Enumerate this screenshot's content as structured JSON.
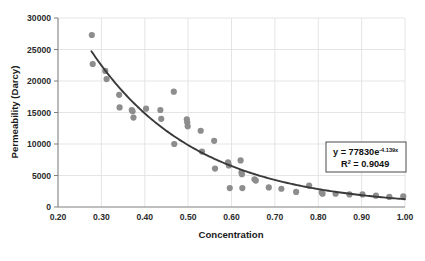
{
  "chart_data": {
    "type": "scatter",
    "title": "",
    "xlabel": "Concentration",
    "ylabel": "Permeability (Darcy)",
    "xlim": [
      0.2,
      1.0
    ],
    "ylim": [
      0,
      30000
    ],
    "xticks": [
      "0.20",
      "0.30",
      "0.40",
      "0.50",
      "0.60",
      "0.70",
      "0.80",
      "0.90",
      "1.00"
    ],
    "xtick_values": [
      0.2,
      0.3,
      0.4,
      0.5,
      0.6,
      0.7,
      0.8,
      0.9,
      1.0
    ],
    "yticks": [
      "0",
      "5000",
      "10000",
      "15000",
      "20000",
      "25000",
      "30000"
    ],
    "ytick_values": [
      0,
      5000,
      10000,
      15000,
      20000,
      25000,
      30000
    ],
    "grid": true,
    "grid_axis": "both",
    "legend": false,
    "marker_color": "#8d8d8d",
    "trendline_color": "#3a3a3a",
    "grid_color": "#e2e2e2",
    "axis_color": "#808080",
    "series": [
      {
        "name": "Permeability vs Concentration",
        "marker": "circle",
        "points": [
          [
            0.278,
            27300
          ],
          [
            0.28,
            22700
          ],
          [
            0.309,
            21600
          ],
          [
            0.312,
            20300
          ],
          [
            0.341,
            17800
          ],
          [
            0.342,
            15800
          ],
          [
            0.37,
            15400
          ],
          [
            0.372,
            15200
          ],
          [
            0.374,
            14200
          ],
          [
            0.403,
            15600
          ],
          [
            0.436,
            15400
          ],
          [
            0.438,
            14000
          ],
          [
            0.467,
            18300
          ],
          [
            0.468,
            10000
          ],
          [
            0.497,
            13900
          ],
          [
            0.498,
            13400
          ],
          [
            0.499,
            12800
          ],
          [
            0.529,
            12100
          ],
          [
            0.532,
            8800
          ],
          [
            0.56,
            10500
          ],
          [
            0.562,
            6100
          ],
          [
            0.592,
            7100
          ],
          [
            0.594,
            6600
          ],
          [
            0.596,
            3000
          ],
          [
            0.621,
            7400
          ],
          [
            0.623,
            5500
          ],
          [
            0.624,
            5200
          ],
          [
            0.625,
            3000
          ],
          [
            0.653,
            4400
          ],
          [
            0.656,
            4200
          ],
          [
            0.686,
            3100
          ],
          [
            0.715,
            2900
          ],
          [
            0.749,
            2400
          ],
          [
            0.779,
            3400
          ],
          [
            0.808,
            2300
          ],
          [
            0.81,
            2100
          ],
          [
            0.84,
            2100
          ],
          [
            0.872,
            2000
          ],
          [
            0.902,
            2000
          ],
          [
            0.933,
            1800
          ],
          [
            0.964,
            1600
          ],
          [
            0.996,
            1700
          ]
        ]
      }
    ],
    "trendline": {
      "type": "exponential",
      "coefficient": 77830,
      "exponent": -4.139,
      "r_squared": 0.9049,
      "x_start": 0.277,
      "x_end": 1.0
    },
    "annotation": {
      "equation_prefix": "y = 77830e",
      "equation_exponent": "-4.139x",
      "r2_prefix": "R",
      "r2_sup": "2",
      "r2_value": " = 0.9049"
    }
  }
}
